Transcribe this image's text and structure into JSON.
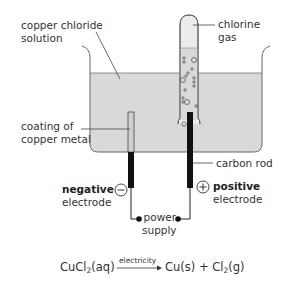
{
  "diagram": {
    "labels": {
      "solution": [
        "copper chloride",
        "solution"
      ],
      "gas": [
        "chlorine",
        "gas"
      ],
      "coating": [
        "coating of",
        "copper metal"
      ],
      "carbon_rod": "carbon rod",
      "negative": {
        "word": "negative",
        "sign": "−",
        "electrode": "electrode"
      },
      "positive": {
        "word": "positive",
        "sign": "+",
        "electrode": "electrode"
      },
      "power_supply": [
        "power",
        "supply"
      ]
    },
    "equation": {
      "reactant": "CuCl",
      "reactant_sub": "2",
      "reactant_state": "(aq)",
      "condition": "electricity",
      "product1": "Cu(s)",
      "plus": "+",
      "product2": "Cl",
      "product2_sub": "2",
      "product2_state": "(g)"
    },
    "colors": {
      "solution": "#d9d9d9",
      "gas": "#ececec",
      "outline": "#555555",
      "electrode": "#111111"
    }
  }
}
